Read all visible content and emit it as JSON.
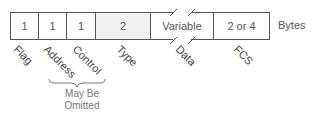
{
  "diagram": {
    "unit_label": "Bytes",
    "fields": [
      {
        "name": "Flag",
        "size": "1"
      },
      {
        "name": "Address",
        "size": "1"
      },
      {
        "name": "Control",
        "size": "1"
      },
      {
        "name": "Type",
        "size": "2"
      },
      {
        "name": "Data",
        "size": "Variable"
      },
      {
        "name": "FCS",
        "size": "2 or 4"
      }
    ],
    "note": {
      "line1": "May Be",
      "line2": "Omitted"
    }
  }
}
